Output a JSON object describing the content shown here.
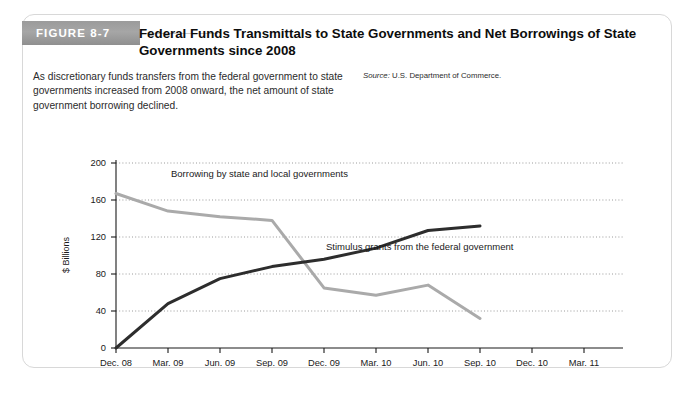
{
  "figure": {
    "badge_label": "FIGURE 8-7",
    "title": "Federal Funds Transmittals to State Governments and Net Borrowings of State Governments since 2008",
    "description": "As discretionary funds transfers from the federal government to state governments increased from 2008 onward, the net amount of state government borrowing declined.",
    "source_word": "Source:",
    "source_text": "U.S. Department of Commerce."
  },
  "colors": {
    "badge_gray": "#9b9b9b",
    "card_border": "#d8d8d8",
    "dark_series": "#2d2d2d",
    "light_series": "#aaaaaa",
    "axis": "#1a1a1a",
    "gridline": "#9a9a9a"
  },
  "chart_data": {
    "type": "line",
    "title": "Federal Funds Transmittals to State Governments and Net Borrowings of State Governments since 2008",
    "xlabel": "",
    "ylabel": "$ Billions",
    "categories": [
      "Dec. 08",
      "Mar. 09",
      "Jun. 09",
      "Sep. 09",
      "Dec. 09",
      "Mar. 10",
      "Jun. 10",
      "Sep. 10",
      "Dec. 10",
      "Mar. 11"
    ],
    "yticks": [
      0,
      40,
      80,
      120,
      160,
      200
    ],
    "ylim": [
      0,
      200
    ],
    "grid": true,
    "legend": "inline-annotations",
    "series": [
      {
        "name": "Borrowing by state and local governments",
        "color": "#aaaaaa",
        "x": [
          "Dec. 08",
          "Mar. 09",
          "Jun. 09",
          "Sep. 09",
          "Dec. 09",
          "Mar. 10",
          "Jun. 10",
          "Sep. 10"
        ],
        "values": [
          167,
          148,
          142,
          138,
          65,
          57,
          68,
          32
        ]
      },
      {
        "name": "Stimulus grants from the federal government",
        "color": "#2d2d2d",
        "x": [
          "Dec. 08",
          "Mar. 09",
          "Jun. 09",
          "Sep. 09",
          "Dec. 09",
          "Mar. 10",
          "Jun. 10",
          "Sep. 10"
        ],
        "values": [
          0,
          48,
          75,
          88,
          96,
          108,
          127,
          132
        ]
      }
    ],
    "annotations": [
      {
        "text": "Borrowing by state and local governments",
        "x": "Mar. 09",
        "y": 184
      },
      {
        "text": "Stimulus grants from the federal government",
        "x": "Dec. 09",
        "y": 98
      }
    ]
  }
}
